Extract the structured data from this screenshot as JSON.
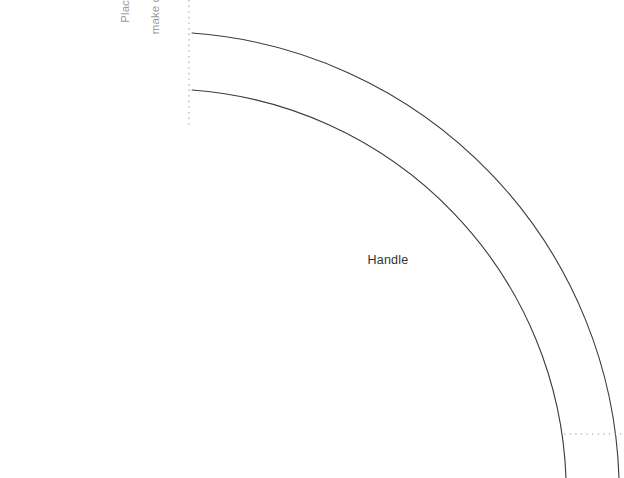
{
  "canvas": {
    "width": 624,
    "height": 478,
    "background": "#ffffff"
  },
  "pattern": {
    "title": "Handle pattern piece",
    "handle_label": "Handle",
    "fold_note": "Place on fold\nor flip to\nmake complete\npattern.",
    "fold_note_lines": [
      "Place on fold",
      "or flip to",
      "make complete",
      "pattern."
    ],
    "line_color": "#3a3a3a",
    "note_color": "#9b9b9b",
    "label_color": "#333333",
    "guide_color": "#a0a0a0",
    "stroke_width": 1,
    "geometry": {
      "arc_center_x": 192,
      "arc_center_y": 494,
      "outer_radius": 461,
      "inner_radius": 404,
      "outer_start": [
        192,
        33
      ],
      "inner_start": [
        192,
        90
      ],
      "outer_end": [
        619,
        478
      ],
      "inner_end": [
        566,
        478
      ],
      "fold_line_x": 189,
      "fold_line_y_start": 0,
      "fold_line_y_end": 126,
      "cut_line_y": 434,
      "cut_line_x_start": 565,
      "cut_line_x_end": 621
    }
  }
}
